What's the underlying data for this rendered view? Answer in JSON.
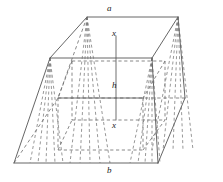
{
  "figure": {
    "kind": "geometry-diagram",
    "stroke_color": "#555555",
    "dashed_color": "#6b6b6b",
    "background_color": "#ffffff",
    "labels": [
      {
        "name": "top-edge-label-a",
        "text": "a",
        "x": 107,
        "y": 4
      },
      {
        "name": "top-x-label",
        "text": "x",
        "x": 112,
        "y": 29
      },
      {
        "name": "height-label-h",
        "text": "h",
        "x": 112,
        "y": 81
      },
      {
        "name": "bottom-x-label",
        "text": "x",
        "x": 112,
        "y": 121
      },
      {
        "name": "bottom-edge-label-b",
        "text": "b",
        "x": 107,
        "y": 166
      }
    ],
    "geometry": {
      "top_face": {
        "back_left": [
          87,
          17
        ],
        "back_right": [
          178,
          17
        ],
        "front_right": [
          152,
          58
        ],
        "front_left": [
          50,
          58
        ]
      },
      "bottom_face": {
        "back_left": [
          58,
          98
        ],
        "back_right": [
          185,
          98
        ],
        "front_right": [
          158,
          163
        ],
        "front_left": [
          14,
          163
        ]
      },
      "inner_top": {
        "back_left": [
          72,
          61
        ],
        "back_right": [
          165,
          61
        ],
        "front_right": [
          143,
          98
        ],
        "front_left": [
          58,
          98
        ]
      },
      "height_axis": {
        "top": [
          116,
          36
        ],
        "bottom": [
          116,
          120
        ]
      }
    }
  }
}
